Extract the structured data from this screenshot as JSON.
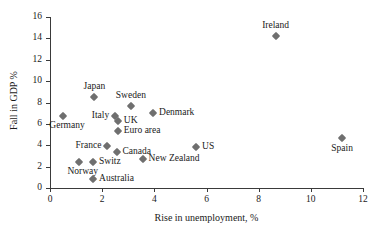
{
  "chart_data": {
    "type": "scatter",
    "title": "",
    "xlabel": "Rise in unemployment, %",
    "ylabel": "Fall in GDP %",
    "xlim": [
      0,
      12
    ],
    "ylim": [
      0,
      16
    ],
    "xticks": [
      0,
      2,
      4,
      6,
      8,
      10,
      12
    ],
    "yticks": [
      0,
      2,
      4,
      6,
      8,
      10,
      12,
      14,
      16
    ],
    "xtick_labels": [
      "0",
      "2",
      "4",
      "6",
      "8",
      "10",
      "12"
    ],
    "ytick_labels": [
      "0",
      "2",
      "4",
      "6",
      "8",
      "10",
      "12",
      "14",
      "16"
    ],
    "grid": false,
    "legend": false,
    "marker_color": "#6f6f6f",
    "marker_shape": "diamond",
    "axis_color": "#3a3a3a",
    "points": [
      {
        "label": "Germany",
        "x": 0.5,
        "y": 6.7,
        "label_pos": "below-left"
      },
      {
        "label": "Norway",
        "x": 1.1,
        "y": 2.4,
        "label_pos": "below-left"
      },
      {
        "label": "Switz",
        "x": 1.65,
        "y": 2.45,
        "label_pos": "right"
      },
      {
        "label": "Australia",
        "x": 1.65,
        "y": 0.85,
        "label_pos": "right"
      },
      {
        "label": "Japan",
        "x": 1.7,
        "y": 8.5,
        "label_pos": "above"
      },
      {
        "label": "France",
        "x": 2.2,
        "y": 3.9,
        "label_pos": "left"
      },
      {
        "label": "Italy",
        "x": 2.5,
        "y": 6.75,
        "label_pos": "left"
      },
      {
        "label": "Canada",
        "x": 2.55,
        "y": 3.4,
        "label_pos": "right"
      },
      {
        "label": "UK",
        "x": 2.6,
        "y": 6.25,
        "label_pos": "right"
      },
      {
        "label": "Euro area",
        "x": 2.6,
        "y": 5.3,
        "label_pos": "right"
      },
      {
        "label": "Sweden",
        "x": 3.1,
        "y": 7.7,
        "label_pos": "above"
      },
      {
        "label": "New Zealand",
        "x": 3.55,
        "y": 2.7,
        "label_pos": "right"
      },
      {
        "label": "Denmark",
        "x": 3.95,
        "y": 7.05,
        "label_pos": "right"
      },
      {
        "label": "US",
        "x": 5.6,
        "y": 3.85,
        "label_pos": "right"
      },
      {
        "label": "Ireland",
        "x": 8.65,
        "y": 14.2,
        "label_pos": "above"
      },
      {
        "label": "Spain",
        "x": 11.2,
        "y": 4.65,
        "label_pos": "below"
      }
    ]
  }
}
